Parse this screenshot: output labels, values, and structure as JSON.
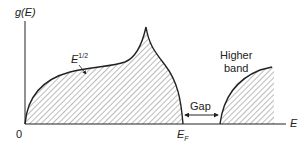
{
  "diagram": {
    "y_axis_label": "g(E)",
    "x_axis_label": "E",
    "origin_label": "0",
    "curve_label_base": "E",
    "curve_label_exp": "1/2",
    "fermi_label_base": "E",
    "fermi_label_sub": "F",
    "gap_label": "Gap",
    "higher_band_label_line1": "Higher",
    "higher_band_label_line2": "band",
    "colors": {
      "line": "#222222",
      "hatch": "#444444",
      "background": "#ffffff"
    }
  }
}
